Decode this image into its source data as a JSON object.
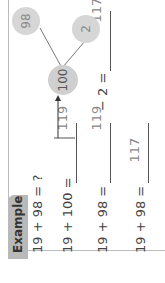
{
  "section": {
    "tab_label": "Example"
  },
  "rows": [
    {
      "expression": "19 + 98 = ?"
    },
    {
      "expression": "19 + 100 =",
      "answer": "119"
    },
    {
      "expression": "19 + 98 =",
      "answer": "119",
      "operation": "− 2 =",
      "result": "117"
    },
    {
      "expression": "19 + 98 =",
      "answer": "117"
    }
  ],
  "number_bond": {
    "whole": "100",
    "parts": [
      "98",
      "2"
    ]
  },
  "arrow": "→"
}
